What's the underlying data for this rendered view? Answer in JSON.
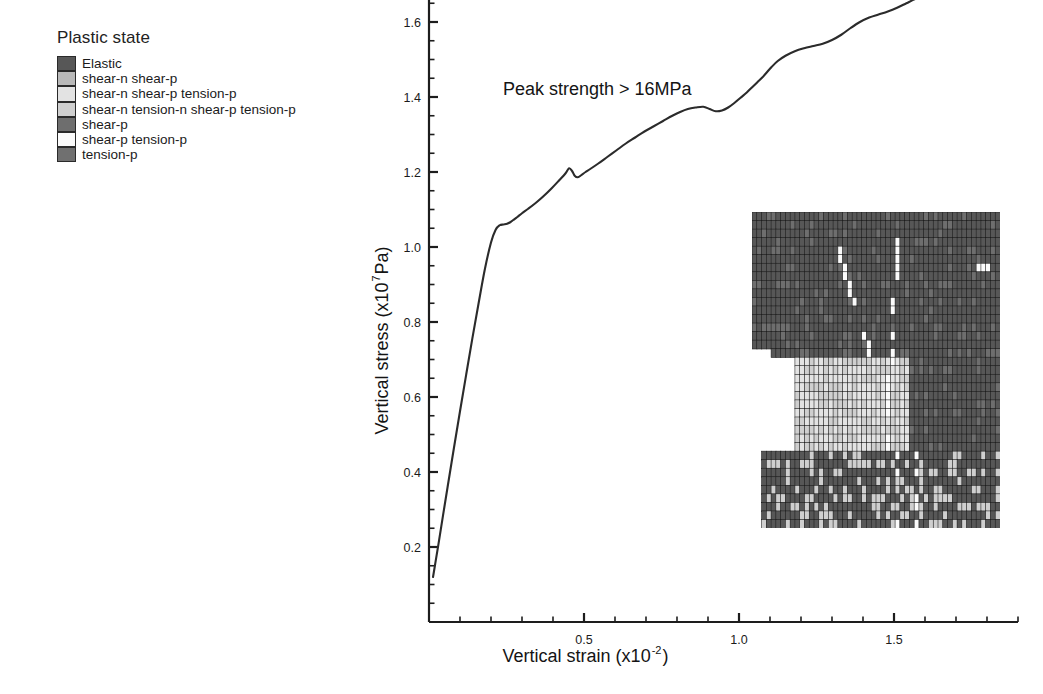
{
  "legend": {
    "title": "Plastic state",
    "items": [
      {
        "label": "Elastic",
        "color": "#575757"
      },
      {
        "label": "shear-n shear-p",
        "color": "#b9b9b9"
      },
      {
        "label": "shear-n shear-p tension-p",
        "color": "#e3e3e3"
      },
      {
        "label": "shear-n tension-n shear-p tension-p",
        "color": "#cfcfcf"
      },
      {
        "label": "shear-p",
        "color": "#6e6e6e"
      },
      {
        "label": "shear-p tension-p",
        "color": "#fbfbfb"
      },
      {
        "label": "tension-p",
        "color": "#707070"
      }
    ]
  },
  "annotation": {
    "text": "Peak strength > 16MPa"
  },
  "chart_data": {
    "type": "line",
    "title": "",
    "xlabel": "Vertical strain (x10",
    "xlabel_sup": "-2",
    "xlabel_tail": ")",
    "ylabel": "Vertical stress (x10",
    "ylabel_sup": "7",
    "ylabel_tail": " Pa)",
    "xlim": [
      0,
      1.9
    ],
    "ylim": [
      0,
      1.83
    ],
    "xticks": [
      0.5,
      1.0,
      1.5
    ],
    "xticklabels": [
      "0.5",
      "1.0",
      "1.5"
    ],
    "xminor_step": 0.1,
    "yticks": [
      0.2,
      0.4,
      0.6,
      0.8,
      1.0,
      1.2,
      1.4,
      1.6
    ],
    "yticklabels": [
      "0.2",
      "0.4",
      "0.6",
      "0.8",
      "1.0",
      "1.2",
      "1.4",
      "1.6"
    ],
    "yminor_step": 0.05,
    "grid": false,
    "legend_position": "outside-left",
    "series": [
      {
        "name": "stress-strain",
        "x": [
          0.013,
          0.02,
          0.03,
          0.045,
          0.06,
          0.08,
          0.1,
          0.12,
          0.14,
          0.16,
          0.18,
          0.2,
          0.215,
          0.228,
          0.24,
          0.252,
          0.262,
          0.272,
          0.285,
          0.3,
          0.32,
          0.345,
          0.37,
          0.395,
          0.42,
          0.44,
          0.452,
          0.462,
          0.47,
          0.48,
          0.492,
          0.505,
          0.52,
          0.545,
          0.575,
          0.605,
          0.635,
          0.665,
          0.695,
          0.725,
          0.755,
          0.785,
          0.81,
          0.835,
          0.86,
          0.885,
          0.905,
          0.925,
          0.945,
          0.965,
          0.985,
          1.005,
          1.025,
          1.045,
          1.06,
          1.075,
          1.09,
          1.105,
          1.125,
          1.15,
          1.18,
          1.21,
          1.24,
          1.27,
          1.3,
          1.33,
          1.36,
          1.39,
          1.42,
          1.45,
          1.48,
          1.51,
          1.54,
          1.57,
          1.6,
          1.63,
          1.66,
          1.69,
          1.72,
          1.75,
          1.78,
          1.81,
          1.84,
          1.862
        ],
        "y": [
          0.12,
          0.155,
          0.205,
          0.283,
          0.36,
          0.462,
          0.562,
          0.66,
          0.757,
          0.85,
          0.94,
          1.012,
          1.046,
          1.058,
          1.06,
          1.062,
          1.066,
          1.072,
          1.08,
          1.09,
          1.102,
          1.118,
          1.136,
          1.156,
          1.178,
          1.196,
          1.21,
          1.202,
          1.19,
          1.186,
          1.192,
          1.2,
          1.208,
          1.222,
          1.24,
          1.258,
          1.276,
          1.292,
          1.308,
          1.322,
          1.336,
          1.35,
          1.36,
          1.368,
          1.372,
          1.374,
          1.368,
          1.362,
          1.364,
          1.372,
          1.384,
          1.398,
          1.412,
          1.428,
          1.44,
          1.452,
          1.466,
          1.48,
          1.496,
          1.51,
          1.522,
          1.53,
          1.536,
          1.542,
          1.552,
          1.566,
          1.584,
          1.6,
          1.612,
          1.62,
          1.628,
          1.638,
          1.65,
          1.662,
          1.672,
          1.682,
          1.692,
          1.702,
          1.714,
          1.726,
          1.736,
          1.744,
          1.75,
          1.754
        ],
        "color": "#2b2b2b"
      }
    ]
  },
  "inset": {
    "name": "plastic-state-mesh",
    "description": "finite-element mesh colored by plastic state with left notch",
    "cols": 52,
    "rows": 37,
    "width_px": 248,
    "height_px": 316
  }
}
